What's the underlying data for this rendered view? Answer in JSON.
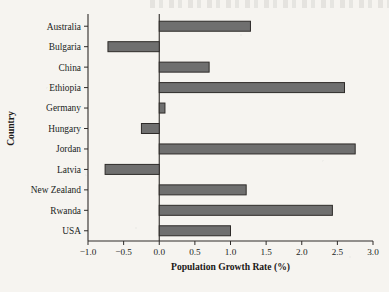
{
  "figure": {
    "background_color": "#f6f4f0",
    "bar_fill_color": "#6f6f6f",
    "bar_edge_color": "#2e2b29",
    "axis_color": "#2e2b29"
  },
  "chart_data": {
    "type": "bar",
    "orientation": "horizontal",
    "title": "",
    "xlabel": "Population Growth Rate (%)",
    "ylabel": "Country",
    "categories": [
      "Australia",
      "Bulgaria",
      "China",
      "Ethiopia",
      "Germany",
      "Hungary",
      "Jordan",
      "Latvia",
      "New Zealand",
      "Rwanda",
      "USA"
    ],
    "values": [
      1.28,
      -0.72,
      0.7,
      2.6,
      0.08,
      -0.25,
      2.75,
      -0.76,
      1.22,
      2.43,
      1.0
    ],
    "xlim": [
      -1.0,
      3.0
    ],
    "xticks": [
      -1.0,
      -0.5,
      0.0,
      0.5,
      1.0,
      1.5,
      2.0,
      2.5,
      3.0
    ],
    "xtick_labels": [
      "−1.0",
      "−0.5",
      "0.0",
      "0.5",
      "1.0",
      "1.5",
      "2.0",
      "2.5",
      "3.0"
    ],
    "grid": false,
    "legend": null,
    "annotations": []
  }
}
